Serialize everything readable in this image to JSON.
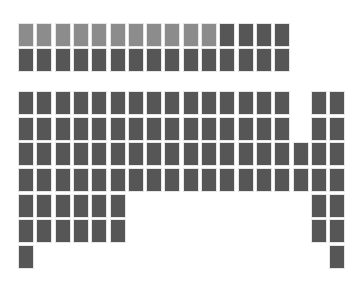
{
  "colors": {
    "light": "#8c8c8c",
    "dark": "#565656",
    "background": "#ffffff"
  },
  "grid": {
    "origin_x": 18,
    "pitch_x": 18.3,
    "cell_width": 16,
    "cell_height": 24
  },
  "top_block": {
    "y": [
      23,
      48
    ],
    "rows": [
      {
        "light": [
          0,
          1,
          2,
          3,
          4,
          5,
          6,
          7,
          8,
          9,
          10
        ],
        "dark": [
          11,
          12,
          13,
          14
        ]
      },
      {
        "light": [],
        "dark": [
          0,
          1,
          2,
          3,
          4,
          5,
          6,
          7,
          8,
          9,
          10,
          11,
          12,
          13,
          14
        ]
      }
    ]
  },
  "bottom_block": {
    "y": [
      91,
      117,
      142,
      168,
      194,
      219,
      245
    ],
    "rows": [
      {
        "dark": [
          0,
          1,
          2,
          3,
          4,
          5,
          6,
          7,
          8,
          9,
          10,
          11,
          12,
          13,
          14,
          16,
          17
        ]
      },
      {
        "dark": [
          0,
          1,
          2,
          3,
          4,
          5,
          6,
          7,
          8,
          9,
          10,
          11,
          12,
          13,
          14,
          16,
          17
        ]
      },
      {
        "dark": [
          0,
          1,
          2,
          3,
          4,
          5,
          6,
          7,
          8,
          9,
          10,
          11,
          12,
          13,
          14,
          15,
          16,
          17
        ]
      },
      {
        "dark": [
          0,
          1,
          2,
          3,
          4,
          5,
          6,
          7,
          8,
          9,
          10,
          11,
          12,
          13,
          14,
          15,
          16,
          17
        ]
      },
      {
        "dark": [
          0,
          1,
          2,
          3,
          4,
          5,
          16,
          17
        ]
      },
      {
        "dark": [
          0,
          1,
          2,
          3,
          4,
          5,
          16,
          17
        ]
      },
      {
        "dark": [
          0,
          17
        ]
      }
    ]
  }
}
